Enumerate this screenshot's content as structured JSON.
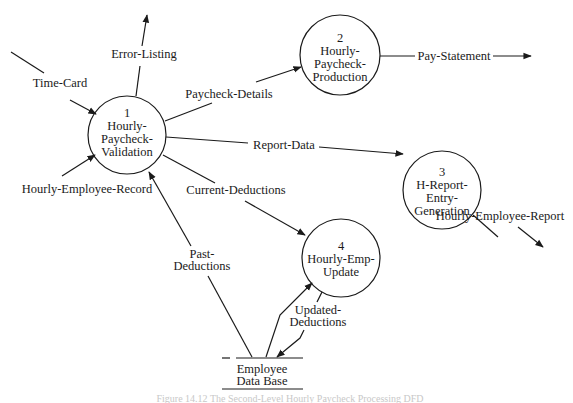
{
  "diagram": {
    "type": "data-flow-diagram",
    "processes": [
      {
        "id": "1",
        "number": "1",
        "lines": [
          "Hourly-",
          "Paycheck-",
          "Validation"
        ],
        "cx": 127,
        "cy": 135,
        "r": 39
      },
      {
        "id": "2",
        "number": "2",
        "lines": [
          "Hourly-",
          "Paycheck-",
          "Production"
        ],
        "cx": 340,
        "cy": 55,
        "r": 40
      },
      {
        "id": "3",
        "number": "3",
        "lines": [
          "H-Report-",
          "Entry-",
          "Generation"
        ],
        "cx": 442,
        "cy": 190,
        "r": 39
      },
      {
        "id": "4",
        "number": "4",
        "lines": [
          "Hourly-Emp-",
          "Update"
        ],
        "cx": 341,
        "cy": 258,
        "r": 39
      }
    ],
    "data_store": {
      "lines": [
        "Employee",
        "Data Base"
      ]
    },
    "flows": [
      {
        "id": "time-card",
        "label": "Time-Card",
        "from": "external",
        "to": "1"
      },
      {
        "id": "error-listing",
        "label": "Error-Listing",
        "from": "1",
        "to": "external"
      },
      {
        "id": "hourly-employee-record",
        "label": "Hourly-Employee-Record",
        "from": "external",
        "to": "1"
      },
      {
        "id": "paycheck-details",
        "label": "Paycheck-Details",
        "from": "1",
        "to": "2"
      },
      {
        "id": "pay-statement",
        "label": "Pay-Statement",
        "from": "2",
        "to": "external"
      },
      {
        "id": "report-data",
        "label": "Report-Data",
        "from": "1",
        "to": "3"
      },
      {
        "id": "hourly-employee-report",
        "label": "Hourly-Employee-Report",
        "from": "3",
        "to": "external"
      },
      {
        "id": "current-deductions",
        "label": "Current-Deductions",
        "from": "1",
        "to": "4"
      },
      {
        "id": "past-deductions",
        "label": "Past-Deductions",
        "lines": [
          "Past-",
          "Deductions"
        ],
        "from": "data-store",
        "to": "1"
      },
      {
        "id": "updated-deductions",
        "label": "Updated-Deductions",
        "lines": [
          "Updated-",
          "Deductions"
        ],
        "from": "4",
        "to": "data-store"
      },
      {
        "id": "store-to-4",
        "label": "",
        "from": "data-store",
        "to": "4"
      }
    ],
    "caption": "Figure 14.12  The Second-Level Hourly Paycheck Processing DFD"
  }
}
